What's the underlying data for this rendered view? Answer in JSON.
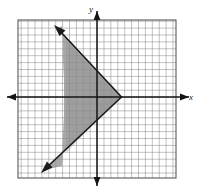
{
  "figure": {
    "type": "coordinate-plane-graph",
    "background_color": "#ffffff",
    "grid": {
      "color": "#6e6e6e",
      "cell_size_px": 6.9,
      "left_px": 18,
      "top_px": 20,
      "right_px": 176,
      "bottom_px": 178,
      "columns": 23,
      "rows": 23,
      "visible": true
    },
    "axes": {
      "color": "#141414",
      "x_axis": {
        "label": "x",
        "y_px": 97,
        "from_px": 6,
        "to_px": 191,
        "arrow_left": true,
        "arrow_right": true
      },
      "y_axis": {
        "label": "y",
        "x_px": 97,
        "from_px": 10,
        "to_px": 187,
        "arrow_up": true,
        "arrow_down": true
      },
      "origin_px": [
        97,
        97
      ]
    },
    "shaded_region": {
      "name": "angle-region",
      "fill_color": "#8f8f8f",
      "fill_opacity": 0.72,
      "description": "V-shaped wedge opening to the left with vertex on the x-axis to the right of the y-axis",
      "vertex_px": [
        121,
        97
      ],
      "left_boundary_x_px": 64,
      "upper_point_px": [
        64,
        40
      ],
      "lower_point_px": [
        64,
        154
      ]
    },
    "lines": [
      {
        "name": "upper-boundary-line",
        "color": "#1a1a1a",
        "width_px": 1.6,
        "start_px": [
          121,
          97
        ],
        "end_px": [
          55,
          27
        ],
        "arrow_at_end": true,
        "direction": "up-left"
      },
      {
        "name": "lower-boundary-line",
        "color": "#1a1a1a",
        "width_px": 1.6,
        "start_px": [
          121,
          97
        ],
        "end_px": [
          42,
          172
        ],
        "arrow_at_end": true,
        "direction": "down-left"
      }
    ],
    "labels": {
      "x_label": "x",
      "y_label": "y"
    }
  }
}
